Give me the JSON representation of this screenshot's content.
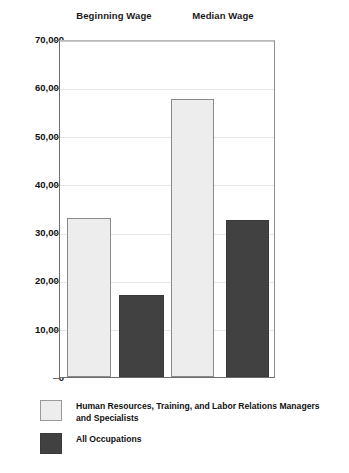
{
  "chart_data": {
    "type": "bar",
    "title": "",
    "xlabel": "",
    "ylabel": "",
    "categories": [
      "Beginning Wage",
      "Median Wage"
    ],
    "series": [
      {
        "name": "Human Resources, Training, and Labor Relations Managers and Specialists",
        "color": "#ededed",
        "values": [
          33000,
          57500
        ]
      },
      {
        "name": "All Occupations",
        "color": "#414141",
        "values": [
          17000,
          32500
        ]
      }
    ],
    "ylim": [
      0,
      70000
    ],
    "ytick_values": [
      0,
      10000,
      20000,
      30000,
      40000,
      50000,
      60000,
      70000
    ],
    "ytick_labels": [
      "0",
      "10,000",
      "20,000",
      "30,000",
      "40,000",
      "50,000",
      "60,000",
      "70,000"
    ],
    "grid": true,
    "grid_axis": "y",
    "legend_position": "bottom-left",
    "bar_border_color": "#8a8a8a",
    "axis_color": "#6d6d6d",
    "gridline_color": "#e6e6e6",
    "background_color": "#ffffff"
  },
  "legend": {
    "items": [
      {
        "label": "Human Resources, Training, and Labor Relations Managers and Specialists",
        "swatch": "light"
      },
      {
        "label": "All Occupations",
        "swatch": "dark"
      }
    ]
  }
}
